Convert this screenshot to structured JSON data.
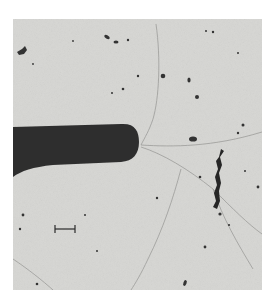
{
  "image": {
    "description": "Grayscale micrograph showing a dark rod-shaped body entering from the left edge, thin branching cracks radiating from its tip, scattered dark particles, an elongated dark filament on the right, and a scale bar in the lower left.",
    "colors": {
      "page_background": "#ffffff",
      "field_background": "#d6d6d3",
      "rod": "#2e2e2e",
      "crack": "#9a9a98",
      "particle": "#3a3a3a"
    },
    "scale_bar": {
      "label": ""
    }
  }
}
